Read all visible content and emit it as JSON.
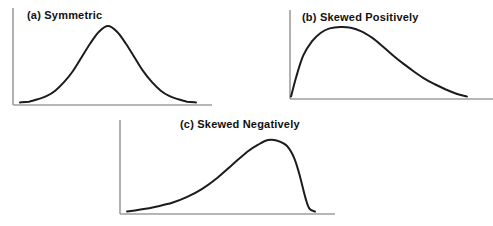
{
  "figure": {
    "background": "#ffffff",
    "curve_color": "#1c1c1c",
    "axis_color": "#9e9e9e",
    "label_color": "#111111"
  },
  "chart_data": {
    "type": "line",
    "title": "",
    "legend": "none",
    "grid": "off",
    "charts": [
      {
        "label": "(a) Symmetric",
        "shape": "symmetric bell curve, peak centered",
        "x_range_normalized": [
          0,
          1
        ],
        "y_range_normalized": [
          0,
          1
        ],
        "points": [
          [
            0.0,
            0.02
          ],
          [
            0.05,
            0.03
          ],
          [
            0.1,
            0.06
          ],
          [
            0.15,
            0.1
          ],
          [
            0.2,
            0.17
          ],
          [
            0.25,
            0.28
          ],
          [
            0.3,
            0.42
          ],
          [
            0.35,
            0.6
          ],
          [
            0.4,
            0.78
          ],
          [
            0.45,
            0.93
          ],
          [
            0.5,
            1.0
          ],
          [
            0.55,
            0.93
          ],
          [
            0.6,
            0.78
          ],
          [
            0.65,
            0.6
          ],
          [
            0.7,
            0.42
          ],
          [
            0.75,
            0.28
          ],
          [
            0.8,
            0.17
          ],
          [
            0.85,
            0.1
          ],
          [
            0.9,
            0.06
          ],
          [
            0.95,
            0.03
          ],
          [
            1.0,
            0.02
          ]
        ]
      },
      {
        "label": "(b) Skewed Positively",
        "shape": "steep rise at left, peak near 0.3, long right tail",
        "x_range_normalized": [
          0,
          1
        ],
        "y_range_normalized": [
          0,
          1
        ],
        "points": [
          [
            0.0,
            0.02
          ],
          [
            0.03,
            0.3
          ],
          [
            0.07,
            0.6
          ],
          [
            0.12,
            0.8
          ],
          [
            0.17,
            0.92
          ],
          [
            0.22,
            0.98
          ],
          [
            0.28,
            1.0
          ],
          [
            0.34,
            0.99
          ],
          [
            0.4,
            0.94
          ],
          [
            0.46,
            0.85
          ],
          [
            0.52,
            0.73
          ],
          [
            0.58,
            0.6
          ],
          [
            0.64,
            0.48
          ],
          [
            0.7,
            0.37
          ],
          [
            0.76,
            0.27
          ],
          [
            0.82,
            0.19
          ],
          [
            0.88,
            0.12
          ],
          [
            0.94,
            0.06
          ],
          [
            1.0,
            0.02
          ]
        ]
      },
      {
        "label": "(c) Skewed Negatively",
        "shape": "long left tail, peak near 0.75, steep drop at right",
        "x_range_normalized": [
          0,
          1
        ],
        "y_range_normalized": [
          0,
          1
        ],
        "points": [
          [
            0.0,
            0.02
          ],
          [
            0.08,
            0.05
          ],
          [
            0.16,
            0.09
          ],
          [
            0.24,
            0.14
          ],
          [
            0.32,
            0.22
          ],
          [
            0.4,
            0.33
          ],
          [
            0.48,
            0.48
          ],
          [
            0.56,
            0.66
          ],
          [
            0.64,
            0.84
          ],
          [
            0.7,
            0.94
          ],
          [
            0.75,
            1.0
          ],
          [
            0.8,
            0.99
          ],
          [
            0.85,
            0.92
          ],
          [
            0.89,
            0.75
          ],
          [
            0.92,
            0.5
          ],
          [
            0.95,
            0.2
          ],
          [
            0.97,
            0.06
          ],
          [
            1.0,
            0.02
          ]
        ]
      }
    ]
  }
}
